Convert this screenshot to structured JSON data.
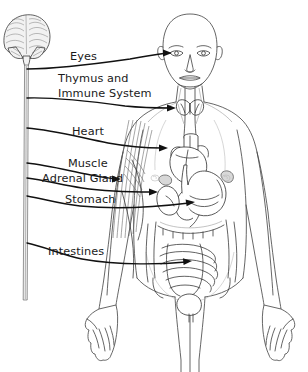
{
  "figure": {
    "background_color": "#ffffff",
    "line_color": "#4a4a4a",
    "leader_color": "#111111",
    "text_color": "#1a1a1a",
    "width": 308,
    "height": 372
  },
  "labels": [
    {
      "id": "eyes",
      "text": "Eyes",
      "lines": [
        "Eyes"
      ],
      "x": 70,
      "y": 60,
      "target": "eye"
    },
    {
      "id": "thymus",
      "text": "Thymus and Immune System",
      "lines": [
        "Thymus and",
        "Immune  System"
      ],
      "x": 58,
      "y": 82,
      "target": "thymus-gland"
    },
    {
      "id": "heart",
      "text": "Heart",
      "lines": [
        "Heart"
      ],
      "x": 72,
      "y": 135,
      "target": "heart-organ"
    },
    {
      "id": "muscle",
      "text": "Muscle",
      "lines": [
        "Muscle"
      ],
      "x": 68,
      "y": 167,
      "target": "arm-muscle"
    },
    {
      "id": "adrenal",
      "text": "Adrenal Gland",
      "lines": [
        "Adrenal Gland"
      ],
      "x": 42,
      "y": 182,
      "target": "adrenal-gland"
    },
    {
      "id": "stomach",
      "text": "Stomach",
      "lines": [
        "Stomach"
      ],
      "x": 65,
      "y": 203,
      "target": "stomach-organ"
    },
    {
      "id": "intestines",
      "text": "Intestines",
      "lines": [
        "Intestines"
      ],
      "x": 48,
      "y": 255,
      "target": "intestines-organ"
    }
  ],
  "anatomy": {
    "brain": "brain-illustration",
    "spinal_cord": "spinal-cord",
    "figure_body": "human-body-outline",
    "organs": [
      "eye",
      "thymus-gland",
      "heart-organ",
      "arm-muscle",
      "adrenal-gland",
      "kidney",
      "stomach-organ",
      "intestines-organ",
      "bladder",
      "esophagus"
    ]
  }
}
